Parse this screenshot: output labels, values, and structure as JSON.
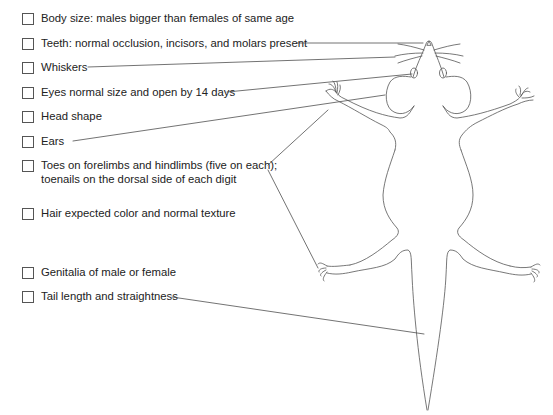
{
  "checklist": {
    "items": [
      {
        "label": "Body size: males bigger than females of same age",
        "top": 11
      },
      {
        "label": "Teeth: normal occlusion, incisors, and molars present",
        "top": 36
      },
      {
        "label": "Whiskers",
        "top": 60
      },
      {
        "label": "Eyes normal size and open by 14 days",
        "top": 85
      },
      {
        "label": "Head shape",
        "top": 109
      },
      {
        "label": "Ears",
        "top": 134
      },
      {
        "label": "Toes on forelimbs and hindlimbs (five on each);",
        "label2": "toenails on the dorsal side of each digit",
        "top": 158
      },
      {
        "label": "Hair expected color and normal texture",
        "top": 206
      },
      {
        "label": "Genitalia of male or female",
        "top": 265
      },
      {
        "label": "Tail length and straightness",
        "top": 289
      }
    ]
  },
  "diagram": {
    "line_color": "#555555"
  }
}
